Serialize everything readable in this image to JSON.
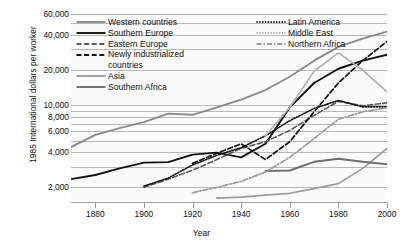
{
  "chart_data": {
    "type": "line",
    "title": "",
    "xlabel": "Year",
    "ylabel": "1985 International dollars per worker",
    "yscale": "log",
    "ylim": [
      1500,
      60000
    ],
    "xlim": [
      1870,
      2000
    ],
    "grid": true,
    "legend_position": "upper-left-inside",
    "xticks": [
      1880,
      1900,
      1920,
      1940,
      1960,
      1980,
      2000
    ],
    "xtick_labels": [
      "1880",
      "1900",
      "1920",
      "1940",
      "1960",
      "1980",
      "2000"
    ],
    "yticks": [
      2000,
      4000,
      6000,
      8000,
      10000,
      20000,
      40000,
      60000
    ],
    "ytick_labels": [
      "2,000",
      "4,000",
      "6,000",
      "8,000",
      "10,000",
      "20,000",
      "40,000",
      "60,000"
    ],
    "gridline_values": [
      60000,
      50000,
      40000,
      30000,
      20000,
      10000,
      9000,
      8000,
      7000,
      6000,
      5000,
      4000,
      3000,
      2000
    ],
    "series": [
      {
        "name": "Western countries",
        "style": "solid",
        "color": "#8a8a8a",
        "width": 1.9,
        "x": [
          1870,
          1880,
          1890,
          1900,
          1910,
          1920,
          1930,
          1940,
          1950,
          1960,
          1970,
          1980,
          1990,
          2000
        ],
        "values": [
          4400,
          5600,
          6400,
          7200,
          8500,
          8300,
          9600,
          11200,
          13500,
          17500,
          24000,
          31500,
          37000,
          42500
        ]
      },
      {
        "name": "Southern Europe",
        "style": "solid",
        "color": "#111111",
        "width": 1.9,
        "x": [
          1870,
          1880,
          1890,
          1900,
          1910,
          1920,
          1930,
          1940,
          1950,
          1960,
          1970,
          1980,
          1990,
          2000
        ],
        "values": [
          2350,
          2550,
          2900,
          3250,
          3280,
          3800,
          3950,
          3600,
          4700,
          9600,
          15500,
          20500,
          24000,
          27000
        ]
      },
      {
        "name": "Eastern Europe",
        "style": "dashed",
        "color": "#5a5a5a",
        "width": 1.6,
        "x": [
          1900,
          1910,
          1920,
          1930,
          1940,
          1950,
          1960,
          1970,
          1980,
          1990,
          2000
        ],
        "values": [
          2000,
          2350,
          2800,
          3450,
          4300,
          4900,
          6100,
          8200,
          10800,
          9900,
          10500
        ]
      },
      {
        "name": "Newly industrialized countries",
        "style": "dashed",
        "color": "#111111",
        "width": 1.7,
        "x": [
          1920,
          1930,
          1940,
          1950,
          1960,
          1970,
          1980,
          1990,
          2000
        ],
        "values": [
          3200,
          3900,
          4700,
          3450,
          4900,
          8800,
          15500,
          24000,
          35000
        ]
      },
      {
        "name": "Asia",
        "style": "solid",
        "color": "#9a9a9a",
        "width": 1.7,
        "x": [
          1930,
          1940,
          1950,
          1960,
          1970,
          1980,
          1990,
          2000
        ],
        "values": [
          1620,
          1650,
          1720,
          1780,
          1950,
          2150,
          2900,
          4300
        ]
      },
      {
        "name": "Southern Africa",
        "style": "solid",
        "color": "#6e6e6e",
        "width": 2.0,
        "x": [
          1950,
          1960,
          1970,
          1980,
          1990,
          2000
        ],
        "values": [
          2750,
          2780,
          3300,
          3500,
          3300,
          3150
        ]
      },
      {
        "name": "Latin America",
        "style": "dotted",
        "color": "#111111",
        "width": 1.6,
        "x": [
          1900,
          1910,
          1920,
          1930,
          1940,
          1950,
          1960,
          1970,
          1980,
          1990,
          2000
        ],
        "values": [
          2050,
          2400,
          3100,
          3750,
          4350,
          5500,
          7400,
          9400,
          11000,
          9700,
          9700
        ]
      },
      {
        "name": "Middle East",
        "style": "dotted",
        "color": "#b0b0b0",
        "width": 1.8,
        "x": [
          1950,
          1960,
          1970,
          1980,
          1990,
          2000
        ],
        "values": [
          5500,
          9600,
          19500,
          28000,
          20000,
          13000
        ]
      },
      {
        "name": "Northern Africa",
        "style": "dashdot",
        "color": "#9a9a9a",
        "width": 1.7,
        "x": [
          1920,
          1930,
          1940,
          1950,
          1960,
          1970,
          1980,
          1990,
          2000
        ],
        "values": [
          1800,
          2000,
          2250,
          2700,
          3600,
          5200,
          7600,
          8800,
          9500
        ]
      }
    ]
  },
  "axes": {
    "y_title": "1985 International dollars per worker",
    "x_title": "Year"
  },
  "legend": {
    "left_column": [
      {
        "label": "Western countries",
        "style": "solid",
        "color": "#8a8a8a"
      },
      {
        "label": "Southern Europe",
        "style": "solid",
        "color": "#111111"
      },
      {
        "label": "Eastern Europe",
        "style": "dashed",
        "color": "#5a5a5a"
      },
      {
        "label": "Newly industrialized",
        "style": "dashed",
        "color": "#111111"
      },
      {
        "label": "countries",
        "style": "none",
        "color": "#111111"
      },
      {
        "label": "Asia",
        "style": "solid",
        "color": "#9a9a9a"
      },
      {
        "label": "Southern Africa",
        "style": "solid",
        "color": "#6e6e6e"
      }
    ],
    "right_column": [
      {
        "label": "Latin America",
        "style": "dotted",
        "color": "#111111"
      },
      {
        "label": "Middle East",
        "style": "dotted",
        "color": "#b0b0b0"
      },
      {
        "label": "Northern Africa",
        "style": "dashdot",
        "color": "#9a9a9a"
      }
    ]
  }
}
